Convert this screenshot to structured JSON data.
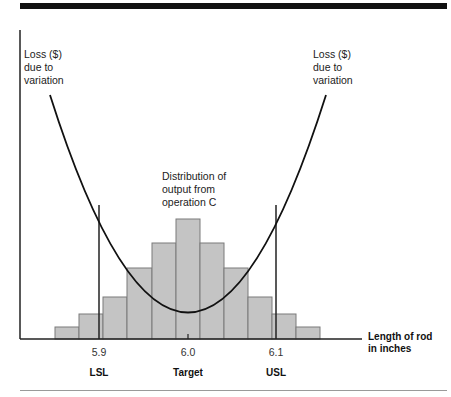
{
  "figure": {
    "annotations": {
      "loss_left": [
        "Loss ($)",
        "due to",
        "variation"
      ],
      "loss_right": [
        "Loss ($)",
        "due to",
        "variation"
      ],
      "distribution": [
        "Distribution of",
        "output from",
        "operation C"
      ]
    },
    "x_axis_title": [
      "Length of rod",
      "in inches"
    ],
    "ticks": [
      {
        "label": "5.9",
        "x": 99
      },
      {
        "label": "6.0",
        "x": 188
      },
      {
        "label": "6.1",
        "x": 276
      }
    ],
    "spec_labels": [
      {
        "label": "LSL",
        "x": 99
      },
      {
        "label": "Target",
        "x": 188
      },
      {
        "label": "USL",
        "x": 276
      }
    ],
    "colors": {
      "bar_fill": "#c4c4c4",
      "bar_stroke": "#7a7a7a",
      "line": "#111111"
    }
  },
  "chart_data": {
    "type": "bar",
    "xlabel": "Length of rod in inches",
    "ylabel": "Loss ($) due to variation",
    "categories": [
      "5.85",
      "5.875",
      "5.9",
      "5.925",
      "5.95",
      "5.975",
      "6.0",
      "6.025",
      "6.05",
      "6.075",
      "6.1",
      "6.125",
      "6.15"
    ],
    "histogram_bins": [
      {
        "x0": 55,
        "x1": 79,
        "top": 327
      },
      {
        "x0": 79,
        "x1": 103,
        "top": 314
      },
      {
        "x0": 103,
        "x1": 127,
        "top": 297
      },
      {
        "x0": 127,
        "x1": 152,
        "top": 268
      },
      {
        "x0": 152,
        "x1": 176,
        "top": 243
      },
      {
        "x0": 176,
        "x1": 200,
        "top": 219
      },
      {
        "x0": 200,
        "x1": 224,
        "top": 243
      },
      {
        "x0": 224,
        "x1": 248,
        "top": 268
      },
      {
        "x0": 248,
        "x1": 272,
        "top": 297
      },
      {
        "x0": 272,
        "x1": 296,
        "top": 314
      },
      {
        "x0": 296,
        "x1": 320,
        "top": 327
      }
    ],
    "relative_frequency": [
      1,
      2,
      3.5,
      6,
      8,
      10,
      8,
      6,
      3.5,
      2,
      1
    ],
    "spec_limits": {
      "LSL": 5.9,
      "Target": 6.0,
      "USL": 6.1
    },
    "loss_curve": "quadratic, minimum at Target"
  }
}
